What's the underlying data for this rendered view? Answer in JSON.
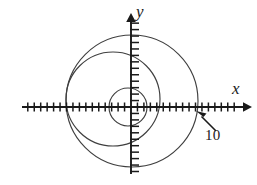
{
  "figure": {
    "kind": "polar-plot",
    "background": "#ffffff",
    "width": 257,
    "height": 185,
    "stroke_axis": "#1a1a1a",
    "stroke_curve": "#3a3a3a"
  },
  "axes": {
    "x_label": "x",
    "y_label": "y",
    "origin": {
      "x": 131,
      "y": 107
    },
    "x_axis": {
      "start_x": 22,
      "end_x": 246,
      "y": 107,
      "arrow": "right"
    },
    "y_axis": {
      "x": 131,
      "start_y": 172,
      "end_y": 13,
      "arrow": "up"
    },
    "tick_spacing_px": 6.45,
    "tick_length_px": 9,
    "x_ticks_left": 17,
    "x_ticks_right": 17,
    "y_ticks_up": 14,
    "y_ticks_down": 10,
    "grid": false
  },
  "annotations": [
    {
      "name": "radius-callout",
      "text": "10",
      "arrow_from": {
        "x": 216,
        "y": 131
      },
      "arrow_to": {
        "x": 197,
        "y": 112
      }
    }
  ],
  "chart_data": {
    "type": "line",
    "title": "",
    "subtitle": "",
    "xlabel": "x",
    "ylabel": "y",
    "grid": false,
    "legend": "none",
    "xlim": [
      -17,
      17
    ],
    "ylim": [
      -10,
      14
    ],
    "annotations": [
      "10"
    ],
    "series": [
      {
        "name": "circle-small",
        "type": "circle",
        "center_px": {
          "x": 128,
          "y": 107
        },
        "radius_px": 19,
        "cross_x_left_px": 109,
        "cross_x_right_px": 147,
        "cross_y_top_px": 88,
        "cross_y_bottom_px": 126
      },
      {
        "name": "circle-medium",
        "type": "circle",
        "center_px": {
          "x": 113,
          "y": 99
        },
        "radius_px": 47,
        "cross_x_left_px": 66,
        "cross_x_right_px": 160,
        "cross_y_top_px": 52,
        "cross_y_bottom_px": 146
      },
      {
        "name": "circle-large",
        "type": "circle",
        "center_px": {
          "x": 132,
          "y": 101
        },
        "radius_px": 66,
        "cross_x_left_px": 66,
        "cross_x_right_px": 198,
        "cross_y_top_px": 35,
        "cross_y_bottom_px": 167
      }
    ]
  }
}
